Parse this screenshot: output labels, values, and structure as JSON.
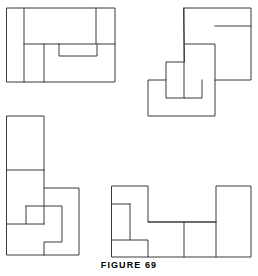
{
  "page": {
    "caption": "FIGURE 69",
    "background_color": "#ffffff",
    "line_color": "#3a3a3a",
    "fill_color": "#ffffff",
    "width": 258,
    "height": 276
  },
  "figures": [
    {
      "id": "figure-top-left",
      "name": "dissected-rectangle-top-left",
      "description": "Rectangle dissected into interlocking pieces",
      "outline": "7,8 115,8 115,82 7,82",
      "cuts": [
        "M 24,8 L 24,82",
        "M 24,44 L 96,44 L 96,8",
        "M 44,44 L 44,82",
        "M 59,44 L 59,56 L 97,56 L 97,44",
        "M 97,44 L 115,44"
      ]
    },
    {
      "id": "figure-top-right",
      "name": "dissected-polygon-top-right",
      "description": "Staircase polygon dissected into interlocking pieces",
      "outline": "184,8 251,8 251,80 215,80 215,116 148,116 148,80 166,80 166,62 184,62",
      "cuts": [
        "M 184,8 L 184,44 L 215,44 L 215,80",
        "M 215,26 L 251,26",
        "M 184,44 L 184,98 L 202,98 L 202,80",
        "M 166,80 L 166,98 L 184,98"
      ]
    },
    {
      "id": "figure-bottom-left",
      "name": "dissected-polygon-bottom-left",
      "description": "Tall staircase polygon dissected into interlocking pieces",
      "outline": "7,116 44,116 44,188 79,188 79,255 7,255",
      "cuts": [
        "M 7,170 L 44,170",
        "M 26,206 L 26,224 L 44,224",
        "M 26,206 L 62,206 L 62,242 L 44,242 L 44,255",
        "M 7,224 L 26,224",
        "M 44,188 L 44,224"
      ]
    },
    {
      "id": "figure-bottom-right",
      "name": "dissected-polygon-bottom-right",
      "description": "U-shaped polygon dissected into interlocking pieces",
      "outline": "112,186 148,186 148,222 216,222 216,186 251,186 251,257 112,257",
      "cuts": [
        "M 130,204 L 130,240 L 148,240 L 148,257",
        "M 112,204 L 130,204",
        "M 112,240 L 130,240",
        "M 148,222 L 216,222",
        "M 184,222 L 184,257",
        "M 216,222 L 216,257"
      ]
    }
  ]
}
